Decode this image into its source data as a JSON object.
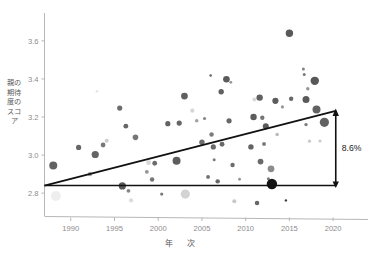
{
  "chart_data": {
    "type": "scatter",
    "title": "",
    "xlabel": "年　次",
    "ylabel": "親の期待度のスコア",
    "xlim": [
      1987.0,
      2022.5
    ],
    "ylim": [
      2.68,
      3.72
    ],
    "xticks": [
      1990,
      1995,
      2000,
      2005,
      2010,
      2015,
      2020
    ],
    "xtick_labels": [
      "1990",
      "1995",
      "2000",
      "2005",
      "2010",
      "2015",
      "2020"
    ],
    "yticks": [
      2.8,
      3.0,
      3.2,
      3.4,
      3.6
    ],
    "ytick_labels": [
      "2.8",
      "3.0",
      "3.2",
      "3.4",
      "3.6"
    ],
    "grid": false,
    "legend": null,
    "bubble_size_note": "marker radius varies by sample weight",
    "points": [
      {
        "x": 1988.0,
        "y": 2.945,
        "r": 4.0,
        "c": "#555555"
      },
      {
        "x": 1988.3,
        "y": 2.785,
        "r": 5.0,
        "c": "#ededed"
      },
      {
        "x": 1990.9,
        "y": 3.04,
        "r": 2.6,
        "c": "#595959"
      },
      {
        "x": 1992.2,
        "y": 2.9,
        "r": 2.2,
        "c": "#9a9a9a"
      },
      {
        "x": 1992.8,
        "y": 3.003,
        "r": 3.6,
        "c": "#585858"
      },
      {
        "x": 1993.0,
        "y": 3.335,
        "r": 1.3,
        "c": "#e2e2e2"
      },
      {
        "x": 1993.7,
        "y": 3.053,
        "r": 2.4,
        "c": "#6d6d6d"
      },
      {
        "x": 1994.1,
        "y": 3.075,
        "r": 2.0,
        "c": "#c9c9c9"
      },
      {
        "x": 1995.9,
        "y": 2.838,
        "r": 3.6,
        "c": "#4a4a4a"
      },
      {
        "x": 1995.6,
        "y": 3.247,
        "r": 2.6,
        "c": "#606060"
      },
      {
        "x": 1996.3,
        "y": 3.152,
        "r": 2.4,
        "c": "#595959"
      },
      {
        "x": 1996.6,
        "y": 2.812,
        "r": 1.9,
        "c": "#7d7d7d"
      },
      {
        "x": 1996.9,
        "y": 2.762,
        "r": 2.1,
        "c": "#d8d8d8"
      },
      {
        "x": 1997.4,
        "y": 3.093,
        "r": 2.8,
        "c": "#6a6a6a"
      },
      {
        "x": 1998.7,
        "y": 2.912,
        "r": 1.9,
        "c": "#8a8a8a"
      },
      {
        "x": 1998.9,
        "y": 2.96,
        "r": 2.4,
        "c": "#d4d4d4"
      },
      {
        "x": 1999.3,
        "y": 2.872,
        "r": 2.2,
        "c": "#686868"
      },
      {
        "x": 1999.6,
        "y": 2.957,
        "r": 2.4,
        "c": "#5f5f5f"
      },
      {
        "x": 2000.4,
        "y": 2.795,
        "r": 1.6,
        "c": "#6e6e6e"
      },
      {
        "x": 2001.1,
        "y": 3.165,
        "r": 2.6,
        "c": "#565656"
      },
      {
        "x": 2002.1,
        "y": 2.97,
        "r": 4.0,
        "c": "#4f4f4f"
      },
      {
        "x": 2002.4,
        "y": 3.168,
        "r": 2.6,
        "c": "#585858"
      },
      {
        "x": 2003.0,
        "y": 3.31,
        "r": 3.4,
        "c": "#525252"
      },
      {
        "x": 2003.1,
        "y": 2.795,
        "r": 4.6,
        "c": "#cfcfcf"
      },
      {
        "x": 2003.9,
        "y": 3.233,
        "r": 2.1,
        "c": "#d2d2d2"
      },
      {
        "x": 2004.4,
        "y": 3.18,
        "r": 1.8,
        "c": "#9b9b9b"
      },
      {
        "x": 2005.0,
        "y": 3.067,
        "r": 2.7,
        "c": "#616161"
      },
      {
        "x": 2005.3,
        "y": 3.192,
        "r": 1.6,
        "c": "#7e7e7e"
      },
      {
        "x": 2005.7,
        "y": 2.885,
        "r": 1.9,
        "c": "#636363"
      },
      {
        "x": 2006.0,
        "y": 3.418,
        "r": 1.3,
        "c": "#555555"
      },
      {
        "x": 2006.1,
        "y": 3.108,
        "r": 2.2,
        "c": "#707070"
      },
      {
        "x": 2006.3,
        "y": 3.043,
        "r": 2.6,
        "c": "#5c5c5c"
      },
      {
        "x": 2006.4,
        "y": 2.975,
        "r": 1.5,
        "c": "#707070"
      },
      {
        "x": 2006.8,
        "y": 2.862,
        "r": 2.2,
        "c": "#5a5a5a"
      },
      {
        "x": 2007.2,
        "y": 3.333,
        "r": 2.7,
        "c": "#535353"
      },
      {
        "x": 2007.3,
        "y": 3.057,
        "r": 2.4,
        "c": "#5b5b5b"
      },
      {
        "x": 2007.8,
        "y": 3.398,
        "r": 3.3,
        "c": "#4d4d4d"
      },
      {
        "x": 2008.1,
        "y": 3.18,
        "r": 2.6,
        "c": "#5a5a5a"
      },
      {
        "x": 2008.3,
        "y": 3.382,
        "r": 1.4,
        "c": "#8a8a8a"
      },
      {
        "x": 2008.5,
        "y": 2.948,
        "r": 2.2,
        "c": "#606060"
      },
      {
        "x": 2008.7,
        "y": 2.758,
        "r": 2.0,
        "c": "#c2c2c2"
      },
      {
        "x": 2009.3,
        "y": 2.873,
        "r": 1.4,
        "c": "#8c8c8c"
      },
      {
        "x": 2010.6,
        "y": 3.043,
        "r": 2.7,
        "c": "#565656"
      },
      {
        "x": 2010.9,
        "y": 3.2,
        "r": 3.2,
        "c": "#4f4f4f"
      },
      {
        "x": 2011.0,
        "y": 3.292,
        "r": 2.1,
        "c": "#d5d5d5"
      },
      {
        "x": 2011.3,
        "y": 2.748,
        "r": 2.3,
        "c": "#5a5a5a"
      },
      {
        "x": 2011.6,
        "y": 3.302,
        "r": 3.2,
        "c": "#525252"
      },
      {
        "x": 2011.7,
        "y": 2.966,
        "r": 2.9,
        "c": "#5d5d5d"
      },
      {
        "x": 2011.9,
        "y": 3.196,
        "r": 2.2,
        "c": "#6a6a6a"
      },
      {
        "x": 2012.1,
        "y": 3.058,
        "r": 2.0,
        "c": "#727272"
      },
      {
        "x": 2012.3,
        "y": 3.152,
        "r": 3.0,
        "c": "#4d4d4d"
      },
      {
        "x": 2012.6,
        "y": 2.876,
        "r": 1.5,
        "c": "#707070"
      },
      {
        "x": 2012.9,
        "y": 2.928,
        "r": 3.4,
        "c": "#828282"
      },
      {
        "x": 2013.0,
        "y": 2.848,
        "r": 5.2,
        "c": "#000000"
      },
      {
        "x": 2013.4,
        "y": 3.285,
        "r": 3.1,
        "c": "#4e4e4e"
      },
      {
        "x": 2013.6,
        "y": 3.108,
        "r": 1.8,
        "c": "#b4b4b4"
      },
      {
        "x": 2014.2,
        "y": 3.253,
        "r": 1.6,
        "c": "#8e8e8e"
      },
      {
        "x": 2014.6,
        "y": 2.762,
        "r": 1.2,
        "c": "#2b2b2b"
      },
      {
        "x": 2015.0,
        "y": 3.64,
        "r": 3.7,
        "c": "#4b4b4b"
      },
      {
        "x": 2015.2,
        "y": 3.296,
        "r": 2.2,
        "c": "#5b5b5b"
      },
      {
        "x": 2016.6,
        "y": 3.452,
        "r": 1.5,
        "c": "#777777"
      },
      {
        "x": 2016.7,
        "y": 3.423,
        "r": 1.5,
        "c": "#6f6f6f"
      },
      {
        "x": 2016.9,
        "y": 3.292,
        "r": 3.5,
        "c": "#4c4c4c"
      },
      {
        "x": 2016.9,
        "y": 3.16,
        "r": 1.7,
        "c": "#727272"
      },
      {
        "x": 2017.1,
        "y": 3.348,
        "r": 1.7,
        "c": "#8b8b8b"
      },
      {
        "x": 2017.3,
        "y": 3.073,
        "r": 1.6,
        "c": "#c4c4c4"
      },
      {
        "x": 2017.9,
        "y": 3.39,
        "r": 4.2,
        "c": "#4a4a4a"
      },
      {
        "x": 2018.1,
        "y": 3.24,
        "r": 4.0,
        "c": "#555555"
      },
      {
        "x": 2018.5,
        "y": 3.074,
        "r": 1.6,
        "c": "#c8c8c8"
      },
      {
        "x": 2019.0,
        "y": 3.172,
        "r": 4.6,
        "c": "#555555"
      }
    ],
    "trend_line": {
      "label": "fitted trend",
      "x_start": 1987.0,
      "y_start": 2.84,
      "x_end": 2020.3,
      "y_end": 3.232,
      "color": "#111111"
    },
    "baseline": {
      "label": "reference level",
      "x_start": 1987.0,
      "x_end": 2020.3,
      "y": 2.84,
      "color": "#111111"
    },
    "annotation": {
      "text": "8.6%",
      "x": 2020.3,
      "y_from": 2.84,
      "y_to": 3.232,
      "arrow": "double-headed-vertical",
      "color": "#111111"
    }
  }
}
